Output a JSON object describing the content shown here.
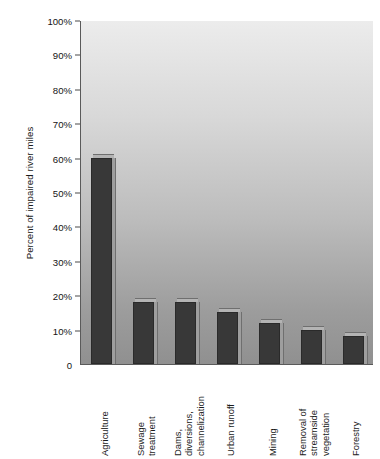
{
  "chart_data": {
    "type": "bar",
    "title": "",
    "subtitle": "",
    "xlabel": "",
    "ylabel": "Percent of impaired river miles",
    "ylim": [
      0,
      100
    ],
    "yticks": [
      0,
      10,
      20,
      30,
      40,
      50,
      60,
      70,
      80,
      90,
      100
    ],
    "ytick_labels": [
      "0",
      "10%",
      "20%",
      "30%",
      "40%",
      "50%",
      "60%",
      "70%",
      "80%",
      "90%",
      "100%"
    ],
    "grid": false,
    "legend": null,
    "legend_position": "none",
    "bar_color": "#383838",
    "plot_background_top_color": "#ececec",
    "plot_background_bottom_color": "#909090",
    "axis_color": "#5a5a5a",
    "categories": [
      "Agriculture",
      "Sewage treatment",
      "Dams, diversions, channelization",
      "Urban runoff",
      "Mining",
      "Removal of streamside vegetation",
      "Forestry"
    ],
    "category_label_lines": [
      [
        "Agriculture"
      ],
      [
        "Sewage",
        "treatment"
      ],
      [
        "Dams,",
        "diversions,",
        "channelization"
      ],
      [
        "Urban runoff"
      ],
      [
        "Mining"
      ],
      [
        "Removal of",
        "streamside",
        "vegetation"
      ],
      [
        "Forestry"
      ]
    ],
    "values": [
      60,
      18,
      18,
      15,
      12,
      10,
      8
    ]
  }
}
